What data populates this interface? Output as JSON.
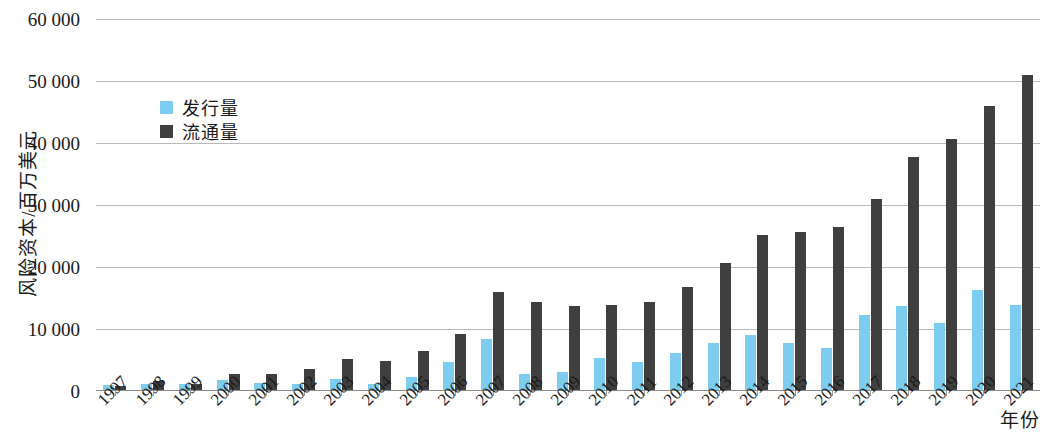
{
  "chart_data": {
    "type": "bar",
    "title": "",
    "xlabel": "年份",
    "ylabel": "风险资本/百万美元",
    "ylim": [
      0,
      60000
    ],
    "ytick_step": 10000,
    "ytick_labels": [
      "60 000",
      "50 000",
      "40 000",
      "30 000",
      "20 000",
      "10 000",
      "0"
    ],
    "ytick_values": [
      60000,
      50000,
      40000,
      30000,
      20000,
      10000,
      0
    ],
    "grid": true,
    "legend_position": "upper-left-inside",
    "categories": [
      "1997",
      "1998",
      "1999",
      "2000",
      "2001",
      "2002",
      "2003",
      "2004",
      "2005",
      "2006",
      "2007",
      "2008",
      "2009",
      "2010",
      "2011",
      "2012",
      "2013",
      "2014",
      "2015",
      "2016",
      "2017",
      "2018",
      "2019",
      "2020",
      "2021"
    ],
    "series": [
      {
        "name": "发行量",
        "color": "#7ccdf0",
        "values": [
          1000,
          1100,
          1200,
          1700,
          1300,
          1100,
          1900,
          1100,
          2200,
          4600,
          8400,
          2800,
          3100,
          5300,
          4700,
          6100,
          7800,
          9000,
          7700,
          7000,
          12300,
          13700,
          10900,
          16300,
          13900
        ]
      },
      {
        "name": "流通量",
        "color": "#3f3f3f",
        "values": [
          800,
          1600,
          1200,
          2700,
          2800,
          3500,
          5100,
          4900,
          6400,
          9200,
          16000,
          14300,
          13700,
          13800,
          14300,
          16800,
          20700,
          25200,
          25700,
          26400,
          31000,
          37800,
          40600,
          46000,
          51000
        ]
      }
    ]
  },
  "legend": {
    "items": [
      {
        "label": "发行量",
        "color": "#7ccdf0",
        "key": "issue"
      },
      {
        "label": "流通量",
        "color": "#3f3f3f",
        "key": "circ"
      }
    ]
  },
  "axes": {
    "y_title": "风险资本/百万美元",
    "x_title": "年份"
  }
}
